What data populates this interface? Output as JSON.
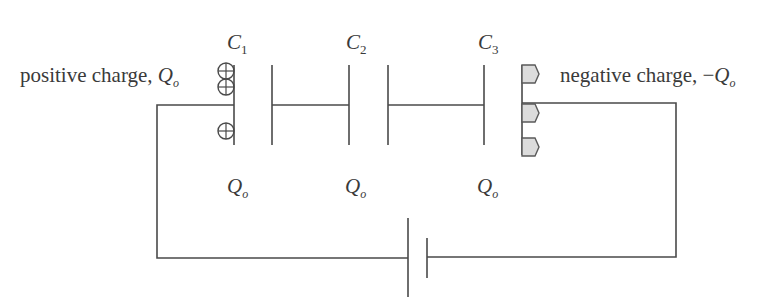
{
  "diagram": {
    "capacitors": [
      {
        "name": "C",
        "subscript": "1",
        "charge": "Q",
        "charge_subscript": "o"
      },
      {
        "name": "C",
        "subscript": "2",
        "charge": "Q",
        "charge_subscript": "o"
      },
      {
        "name": "C",
        "subscript": "3",
        "charge": "Q",
        "charge_subscript": "o"
      }
    ],
    "positive_label": {
      "text": "positive charge, ",
      "symbol": "Q",
      "subscript": "o"
    },
    "negative_label": {
      "text": "negative charge, ",
      "sign": "−",
      "symbol": "Q",
      "subscript": "o"
    },
    "positive_charge_icon": "circle-plus-icon",
    "negative_charge_icon": "pentagon-icon",
    "positive_charge_count": 3,
    "negative_charge_count": 3,
    "colors": {
      "line": "#4a4a4a",
      "negative_fill": "#dcdcdc",
      "text": "#3a3a3a"
    }
  }
}
